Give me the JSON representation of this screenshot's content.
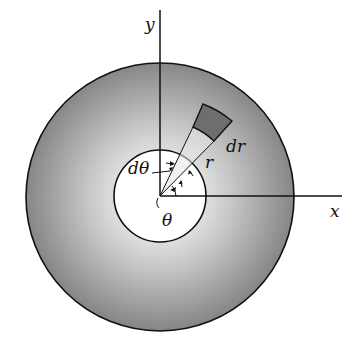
{
  "diagram": {
    "labels": {
      "x_axis": "x",
      "y_axis": "y",
      "radius": "r",
      "radial_increment": "dr",
      "angle_increment": "dθ",
      "angle": "θ"
    },
    "colors": {
      "ring_dark": "#7a7a7a",
      "ring_light": "#d8d8d8",
      "element_fill": "#6e6e6e",
      "stroke": "#111111",
      "hole": "#ffffff"
    }
  }
}
